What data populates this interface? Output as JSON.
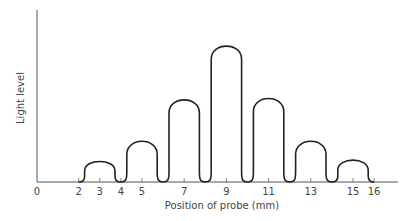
{
  "chart_data": {
    "type": "line",
    "title": "",
    "xlabel": "Position of probe (mm)",
    "ylabel": "Light level",
    "x_ticks": [
      0,
      2,
      3,
      4,
      5,
      7,
      9,
      11,
      13,
      15,
      16
    ],
    "xlim": [
      0,
      16.5
    ],
    "grid": false,
    "legend": null,
    "peaks": [
      {
        "x": 3,
        "relative_height": 0.16
      },
      {
        "x": 5,
        "relative_height": 0.31
      },
      {
        "x": 7,
        "relative_height": 0.61
      },
      {
        "x": 9,
        "relative_height": 1.0
      },
      {
        "x": 11,
        "relative_height": 0.62
      },
      {
        "x": 13,
        "relative_height": 0.31
      },
      {
        "x": 15,
        "relative_height": 0.17
      }
    ],
    "minima": [
      2,
      4,
      6,
      8,
      10,
      12,
      14,
      16
    ],
    "y_tick_labels": []
  }
}
